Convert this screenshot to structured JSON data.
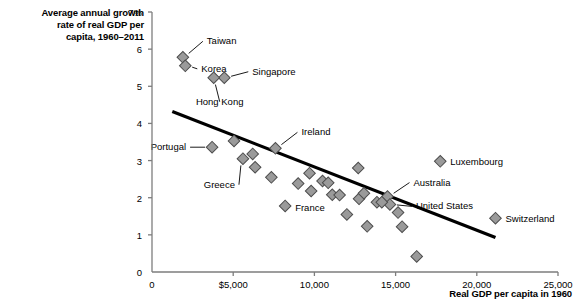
{
  "chart_data": {
    "type": "scatter",
    "title": "",
    "ylabel": "Average annual growth\nrate of real GDP per\ncapita, 1960–2011",
    "xlabel": "Real GDP per capita in 1960",
    "xlim": [
      0,
      25000
    ],
    "ylim": [
      0,
      7
    ],
    "grid": false,
    "legend": "none",
    "xticks": [
      0,
      5000,
      10000,
      15000,
      20000,
      25000
    ],
    "xtick_labels": [
      "0",
      "$5,000",
      "10,000",
      "15,000",
      "20,000",
      "25,000"
    ],
    "yticks": [
      0,
      1,
      2,
      3,
      4,
      5,
      6,
      7
    ],
    "ytick_labels": [
      "0",
      "1",
      "2",
      "3",
      "4",
      "5",
      "6",
      "7%"
    ],
    "marker": "diamond",
    "marker_color": "#9a9a9a",
    "marker_edge_color": "#4d4d4d",
    "trendline": {
      "label": "",
      "color": "#000000",
      "width": 3.2,
      "x0": 1250,
      "y0": 4.32,
      "x1": 21150,
      "y1": 0.93
    },
    "points": [
      {
        "label": "Taiwan",
        "x": 1900,
        "y": 5.78,
        "labeled": true,
        "label_dx": 24,
        "label_dy": -16,
        "anchor": "start"
      },
      {
        "label": "Korea",
        "x": 2050,
        "y": 5.55,
        "labeled": true,
        "label_dx": 16,
        "label_dy": 3,
        "anchor": "start"
      },
      {
        "label": "Singapore",
        "x": 4450,
        "y": 5.23,
        "labeled": true,
        "label_dx": 28,
        "label_dy": -6,
        "anchor": "start"
      },
      {
        "label": "Hong Kong",
        "x": 3800,
        "y": 5.23,
        "labeled": true,
        "label_dx": 6,
        "label_dy": 24,
        "anchor": "middle"
      },
      {
        "label": "Portugal",
        "x": 3700,
        "y": 3.36,
        "labeled": true,
        "label_dx": -26,
        "label_dy": 0,
        "anchor": "end"
      },
      {
        "label": "Greece",
        "x": 5600,
        "y": 3.05,
        "labeled": true,
        "label_dx": -8,
        "label_dy": 26,
        "anchor": "end"
      },
      {
        "label": "Ireland",
        "x": 7600,
        "y": 3.33,
        "labeled": true,
        "label_dx": 26,
        "label_dy": -16,
        "anchor": "start"
      },
      {
        "label": "France",
        "x": 8200,
        "y": 1.78,
        "labeled": true,
        "label_dx": 10,
        "label_dy": 2,
        "anchor": "start"
      },
      {
        "label": "Luxembourg",
        "x": 17750,
        "y": 2.98,
        "labeled": true,
        "label_dx": 10,
        "label_dy": 1,
        "anchor": "start"
      },
      {
        "label": "Australia",
        "x": 14500,
        "y": 2.03,
        "labeled": true,
        "label_dx": 26,
        "label_dy": -14,
        "anchor": "start"
      },
      {
        "label": "United States",
        "x": 14650,
        "y": 1.82,
        "labeled": true,
        "label_dx": 26,
        "label_dy": 2,
        "anchor": "start"
      },
      {
        "label": "Switzerland",
        "x": 21150,
        "y": 1.45,
        "labeled": true,
        "label_dx": 10,
        "label_dy": 1,
        "anchor": "start"
      },
      {
        "label": "",
        "x": 5050,
        "y": 3.53,
        "labeled": false
      },
      {
        "label": "",
        "x": 6200,
        "y": 3.18,
        "labeled": false
      },
      {
        "label": "",
        "x": 6350,
        "y": 2.82,
        "labeled": false
      },
      {
        "label": "",
        "x": 7350,
        "y": 2.55,
        "labeled": false
      },
      {
        "label": "",
        "x": 9000,
        "y": 2.38,
        "labeled": false
      },
      {
        "label": "",
        "x": 9700,
        "y": 2.66,
        "labeled": false
      },
      {
        "label": "",
        "x": 9800,
        "y": 2.18,
        "labeled": false
      },
      {
        "label": "",
        "x": 10500,
        "y": 2.45,
        "labeled": false
      },
      {
        "label": "",
        "x": 10850,
        "y": 2.4,
        "labeled": false
      },
      {
        "label": "",
        "x": 11100,
        "y": 2.08,
        "labeled": false
      },
      {
        "label": "",
        "x": 11550,
        "y": 2.07,
        "labeled": false
      },
      {
        "label": "",
        "x": 12000,
        "y": 1.55,
        "labeled": false
      },
      {
        "label": "",
        "x": 12700,
        "y": 2.8,
        "labeled": false
      },
      {
        "label": "",
        "x": 12750,
        "y": 1.97,
        "labeled": false
      },
      {
        "label": "",
        "x": 13050,
        "y": 2.12,
        "labeled": false
      },
      {
        "label": "",
        "x": 13250,
        "y": 1.23,
        "labeled": false
      },
      {
        "label": "",
        "x": 13850,
        "y": 1.88,
        "labeled": false
      },
      {
        "label": "",
        "x": 14150,
        "y": 1.88,
        "labeled": false
      },
      {
        "label": "",
        "x": 15150,
        "y": 1.6,
        "labeled": false
      },
      {
        "label": "",
        "x": 15400,
        "y": 1.22,
        "labeled": false
      },
      {
        "label": "",
        "x": 16300,
        "y": 0.42,
        "labeled": false
      }
    ]
  }
}
